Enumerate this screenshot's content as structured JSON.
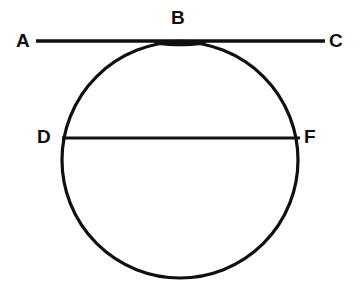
{
  "figure": {
    "background_color": "#ffffff",
    "stroke_color": "#101010",
    "canvas": {
      "width": 361,
      "height": 298
    }
  },
  "labels": {
    "a": "A",
    "b": "B",
    "c": "C",
    "d": "D",
    "f": "F"
  },
  "geometry": {
    "circle": {
      "name": "main-circle",
      "cx": 180,
      "cy": 160,
      "r": 118,
      "stroke_width": 3.2
    },
    "tangent_line": {
      "name": "line-AC",
      "x1": 36,
      "y1": 41,
      "x2": 325,
      "y2": 41,
      "stroke_width": 3.4,
      "tangent_point": "B"
    },
    "chord": {
      "name": "chord-DF",
      "x1": 62,
      "y1": 138,
      "x2": 300,
      "y2": 138,
      "stroke_width": 3.0,
      "endpoints": [
        "D",
        "F"
      ]
    },
    "tangent_blob": {
      "name": "tangency-thickening",
      "cx": 180,
      "cy": 43,
      "rx": 26,
      "ry": 3.2
    }
  }
}
